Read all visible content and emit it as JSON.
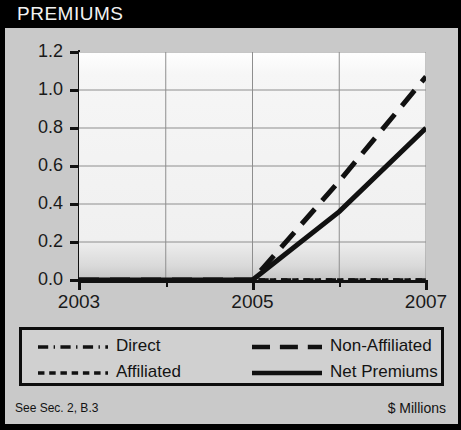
{
  "header": {
    "title": "PREMIUMS"
  },
  "footer": {
    "left_note": "See Sec. 2, B.3",
    "right_note": "$ Millions"
  },
  "legend": {
    "entries": [
      {
        "label": "Direct",
        "style": "dash-dot",
        "color": "#111111"
      },
      {
        "label": "Non-Affiliated",
        "style": "long-dash",
        "color": "#111111"
      },
      {
        "label": "Affiliated",
        "style": "short-dash",
        "color": "#111111"
      },
      {
        "label": "Net Premiums",
        "style": "solid",
        "color": "#111111"
      }
    ]
  },
  "chart_data": {
    "type": "line",
    "title": "PREMIUMS",
    "subtitle": "",
    "xlabel": "",
    "ylabel": "$ Millions",
    "x": [
      2003,
      2004,
      2005,
      2006,
      2007
    ],
    "xlim": [
      2003,
      2007
    ],
    "ylim": [
      0.0,
      1.2
    ],
    "x_tick_labels": [
      "2003",
      "2005",
      "2007"
    ],
    "x_tick_values": [
      2003,
      2005,
      2007
    ],
    "x_minor_tick_values": [
      2004,
      2006
    ],
    "y_ticks": [
      0.0,
      0.2,
      0.4,
      0.6,
      0.8,
      1.0,
      1.2
    ],
    "y_tick_labels": [
      "0.0",
      "0.2",
      "0.4",
      "0.6",
      "0.8",
      "1.0",
      "1.2"
    ],
    "grid": true,
    "legend_position": "below-plot",
    "series": [
      {
        "name": "Direct",
        "style": "dash-dot",
        "color": "#111111",
        "values": [
          0.0,
          0.0,
          0.0,
          0.0,
          0.0
        ]
      },
      {
        "name": "Affiliated",
        "style": "short-dash",
        "color": "#111111",
        "values": [
          0.0,
          0.0,
          0.0,
          0.0,
          0.0
        ]
      },
      {
        "name": "Non-Affiliated",
        "style": "long-dash",
        "color": "#111111",
        "values": [
          0.0,
          0.0,
          0.0,
          0.52,
          1.07
        ]
      },
      {
        "name": "Net Premiums",
        "style": "solid",
        "color": "#111111",
        "values": [
          0.0,
          0.0,
          0.0,
          0.36,
          0.8
        ]
      }
    ]
  }
}
